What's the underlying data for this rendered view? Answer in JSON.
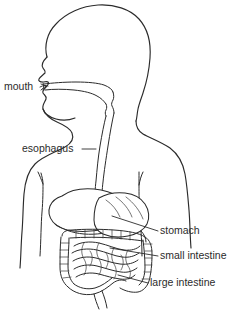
{
  "diagram": {
    "background_color": "#ffffff",
    "line_color": "#2b2b2b",
    "label_color": "#2b2b2b",
    "labels": [
      {
        "id": "mouth",
        "text": "mouth",
        "x": 4,
        "y": 90,
        "side": "left"
      },
      {
        "id": "esophagus",
        "text": "esophagus",
        "x": 22,
        "y": 152,
        "side": "left"
      },
      {
        "id": "stomach",
        "text": "stomach",
        "x": 160,
        "y": 234,
        "side": "right"
      },
      {
        "id": "small-intestine",
        "text": "small intestine",
        "x": 160,
        "y": 259,
        "side": "right"
      },
      {
        "id": "large-intestine",
        "text": "large intestine",
        "x": 150,
        "y": 286,
        "side": "right"
      }
    ]
  }
}
